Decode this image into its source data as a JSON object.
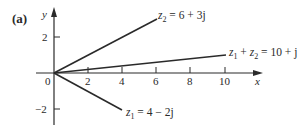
{
  "figure": {
    "panel_label": "(a)",
    "axes": {
      "x_label": "x",
      "y_label": "y",
      "origin_label": "0",
      "x_ticks": [
        "2",
        "4",
        "6",
        "8",
        "10"
      ],
      "y_ticks": [
        "2",
        "−2"
      ]
    },
    "vectors": [
      {
        "name": "z2",
        "label_var": "z",
        "label_sub": "2",
        "label_rest": " = 6 + 3j",
        "re": 6,
        "im": 3
      },
      {
        "name": "z1+z2",
        "label_var": "z",
        "label_sub": "1",
        "label_mid": " + ",
        "label_var2": "z",
        "label_sub2": "2",
        "label_rest": " = 10 + j",
        "re": 10,
        "im": 1
      },
      {
        "name": "z1",
        "label_var": "z",
        "label_sub": "1",
        "label_rest": " = 4 − 2j",
        "re": 4,
        "im": -2
      }
    ],
    "colors": {
      "ink": "#2a2a2a",
      "background": "#ffffff"
    }
  }
}
